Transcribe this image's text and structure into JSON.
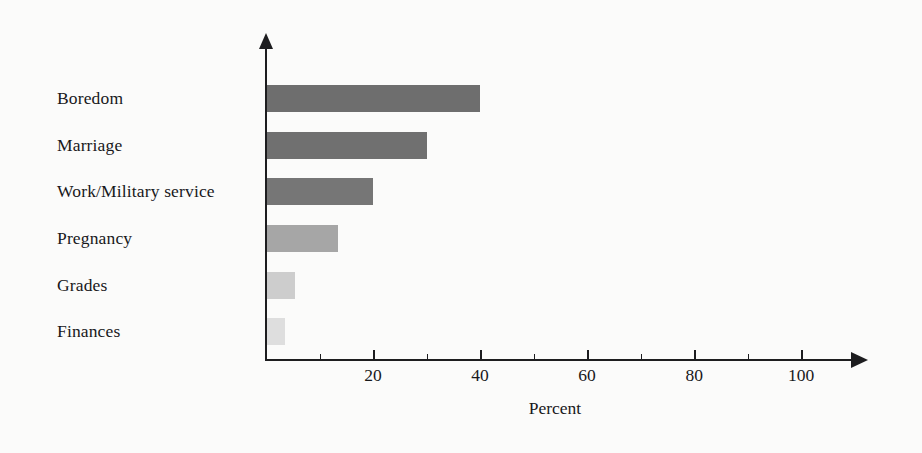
{
  "chart_data": {
    "type": "bar",
    "orientation": "horizontal",
    "title": "",
    "subtitle": "",
    "xlabel": "Percent",
    "ylabel": "",
    "categories": [
      "Boredom",
      "Marriage",
      "Work/Military service",
      "Pregnancy",
      "Grades",
      "Finances"
    ],
    "values": [
      40,
      30,
      20,
      13.5,
      5.5,
      3.5
    ],
    "xlim": [
      0,
      112
    ],
    "ylim": [
      0,
      6
    ],
    "grid": false,
    "legend": false,
    "legend_position": "none",
    "xticks": [
      20,
      40,
      60,
      80,
      100
    ],
    "xtick_labels": [
      "20",
      "40",
      "60",
      "80",
      "100"
    ],
    "xticks_minor": [
      10,
      30,
      50,
      70,
      90
    ],
    "bar_colors": [
      "#6e6e6e",
      "#707070",
      "#767676",
      "#a6a6a6",
      "#cdcdcd",
      "#dedede"
    ],
    "axis_color": "#1d1d1f",
    "background_color": "#fbfbfa",
    "text_color": "#18181a"
  },
  "axis": {
    "x_title": "Percent"
  },
  "ticks": {
    "t20": "20",
    "t40": "40",
    "t60": "60",
    "t80": "80",
    "t100": "100"
  },
  "categories": {
    "c0": "Boredom",
    "c1": "Marriage",
    "c2": "Work/Military service",
    "c3": "Pregnancy",
    "c4": "Grades",
    "c5": "Finances"
  }
}
